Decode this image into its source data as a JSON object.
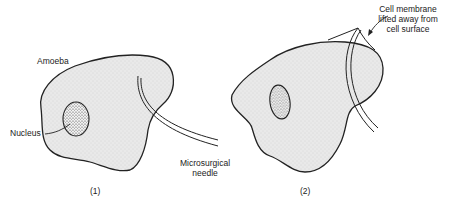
{
  "figure": {
    "panels": [
      {
        "id": "1",
        "caption": "(1)",
        "labels": {
          "cell": "Amoeba",
          "nucleus": "Nucleus",
          "tool_line1": "Microsurgical",
          "tool_line2": "needle"
        }
      },
      {
        "id": "2",
        "caption": "(2)",
        "labels": {
          "membrane_line1": "Cell membrane",
          "membrane_line2": "lifted away from",
          "membrane_line3": "cell surface"
        }
      }
    ],
    "colors": {
      "outline": "#222222",
      "cytoplasm_fill": "#e6e6e6",
      "nucleus_fill": "#d0d0d0",
      "background": "#ffffff"
    }
  }
}
